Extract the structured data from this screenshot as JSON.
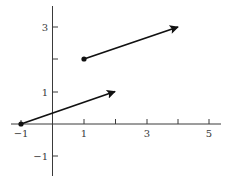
{
  "diagram": {
    "type": "vector-plot",
    "axes": {
      "x_ticks": [
        -1,
        1,
        2,
        3,
        4,
        5
      ],
      "x_tick_labels": [
        {
          "value": -1,
          "label": "−1"
        },
        {
          "value": 1,
          "label": "1"
        },
        {
          "value": 3,
          "label": "3"
        },
        {
          "value": 5,
          "label": "5"
        }
      ],
      "y_ticks": [
        -1,
        1,
        2,
        3
      ],
      "y_tick_labels": [
        {
          "value": 3,
          "label": "3"
        },
        {
          "value": 1,
          "label": "1"
        },
        {
          "value": -1,
          "label": "−1"
        }
      ],
      "x_range": [
        -1.3,
        5.4
      ],
      "y_range": [
        -1.6,
        3.7
      ]
    },
    "vectors": [
      {
        "name": "vector-a",
        "tail": [
          -1,
          0
        ],
        "head": [
          2,
          1
        ]
      },
      {
        "name": "vector-b",
        "tail": [
          1,
          2
        ],
        "head": [
          4,
          3
        ]
      }
    ],
    "colors": {
      "axis": "#3a3a3a",
      "vector": "#111111",
      "label": "#3a3a3a"
    }
  }
}
